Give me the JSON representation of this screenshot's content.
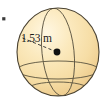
{
  "figure": {
    "type": "sphere-diagram",
    "caption_label": "1.53 m",
    "measure": {
      "value": "1.53",
      "unit": "m",
      "quantity": "radius"
    },
    "colors": {
      "sphere_fill_light": "#fdf0cf",
      "sphere_fill_mid": "#f7dfa9",
      "sphere_fill_edge": "#e9c682",
      "outline": "#4a4231",
      "grid_line": "#5a5340",
      "center_dot": "#111111",
      "dashed_line": "#2a2a2a",
      "text": "#1a1a1a",
      "background": "#ffffff",
      "corner_mark": "#3a3a3a"
    },
    "geometry": {
      "center_x": 58,
      "center_y": 52,
      "radius_x": 41,
      "radius_y": 44,
      "dot_radius": 3.4,
      "radius_line_start_x": 22,
      "radius_line_start_y": 38,
      "radius_line_end_x": 55,
      "radius_line_end_y": 51
    },
    "elements": {
      "sphere_name": "sphere-body",
      "outline_name": "sphere-outline",
      "meridian_name": "meridian-curve",
      "equator_name": "equator-curve",
      "radius_name": "radius-dashed-line",
      "center_name": "center-point",
      "label_name": "radius-label",
      "corner_name": "corner-mark"
    }
  }
}
